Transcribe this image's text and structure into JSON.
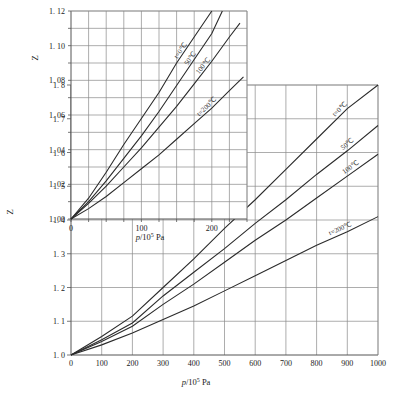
{
  "figure": {
    "name": "compressibility-factor-chart",
    "background": "#ffffff",
    "line_color": "#2b2b2b",
    "grid_color": "#8a8a8a",
    "axis_color": "#555555"
  },
  "chart_data": [
    {
      "id": "main",
      "type": "line",
      "title": "",
      "xlabel": "p/10⁵ Pa",
      "ylabel": "Z",
      "xlim": [
        0,
        1000
      ],
      "ylim": [
        1.0,
        1.8
      ],
      "grid": true,
      "xticks": [
        0,
        100,
        200,
        300,
        400,
        500,
        600,
        700,
        800,
        900,
        1000
      ],
      "xticklabels": [
        "0",
        "100",
        "200",
        "300",
        "400",
        "500",
        "600",
        "700",
        "800",
        "900",
        "1000"
      ],
      "yticks": [
        1.0,
        1.1,
        1.2,
        1.3,
        1.4,
        1.5,
        1.6,
        1.7,
        1.8
      ],
      "yticklabels": [
        "1. 0",
        "1. 1",
        "1. 2",
        "1. 3",
        "1. 4",
        "1. 5",
        "1. 6",
        "1. 7",
        "1. 8"
      ],
      "legend_position": "inline-right",
      "series": [
        {
          "name": "t=0℃",
          "label": "t=0℃",
          "x": [
            0,
            100,
            200,
            300,
            400,
            500,
            600,
            700,
            800,
            900,
            1000
          ],
          "y": [
            1.0,
            1.055,
            1.115,
            1.2,
            1.285,
            1.375,
            1.46,
            1.55,
            1.64,
            1.73,
            1.82
          ]
        },
        {
          "name": "50℃",
          "label": "50℃",
          "x": [
            0,
            100,
            200,
            300,
            400,
            500,
            600,
            700,
            800,
            900,
            1000
          ],
          "y": [
            1.0,
            1.045,
            1.095,
            1.175,
            1.245,
            1.315,
            1.39,
            1.46,
            1.535,
            1.605,
            1.68
          ]
        },
        {
          "name": "100℃",
          "label": "100℃",
          "x": [
            0,
            100,
            200,
            300,
            400,
            500,
            600,
            700,
            800,
            900,
            1000
          ],
          "y": [
            1.0,
            1.04,
            1.085,
            1.15,
            1.21,
            1.275,
            1.34,
            1.4,
            1.465,
            1.53,
            1.595
          ]
        },
        {
          "name": "t=200℃",
          "label": "t=200℃",
          "x": [
            0,
            100,
            200,
            300,
            400,
            500,
            600,
            700,
            800,
            900,
            1000
          ],
          "y": [
            1.0,
            1.03,
            1.065,
            1.105,
            1.145,
            1.19,
            1.235,
            1.28,
            1.325,
            1.365,
            1.41
          ]
        }
      ]
    },
    {
      "id": "inset",
      "type": "line",
      "title": "",
      "xlabel": "p/10⁵ Pa",
      "ylabel": "Z",
      "xlim": [
        0,
        250
      ],
      "ylim": [
        1.0,
        1.12
      ],
      "grid": true,
      "xticks": [
        0,
        25,
        50,
        75,
        100,
        125,
        150,
        175,
        200,
        225,
        250
      ],
      "xticklabels": [
        "0",
        "",
        "",
        "",
        "100",
        "",
        "",
        "",
        "200",
        "",
        ""
      ],
      "yticks": [
        1.0,
        1.01,
        1.02,
        1.03,
        1.04,
        1.05,
        1.06,
        1.07,
        1.08,
        1.09,
        1.1,
        1.11,
        1.12
      ],
      "yticklabels": [
        "1. 00",
        "",
        "1. 02",
        "",
        "1. 04",
        "",
        "1. 06",
        "",
        "1. 08",
        "",
        "1. 10",
        "",
        "1. 12"
      ],
      "legend_position": "inline-top-right",
      "series": [
        {
          "name": "t=0℃",
          "label": "t=0℃",
          "x": [
            0,
            25,
            50,
            75,
            100,
            125,
            150,
            175,
            200
          ],
          "y": [
            1.0,
            1.012,
            1.027,
            1.043,
            1.058,
            1.073,
            1.09,
            1.105,
            1.12
          ]
        },
        {
          "name": "50℃",
          "label": "50℃",
          "x": [
            0,
            25,
            50,
            75,
            100,
            125,
            150,
            175,
            200,
            215
          ],
          "y": [
            1.0,
            1.01,
            1.022,
            1.035,
            1.048,
            1.062,
            1.077,
            1.092,
            1.107,
            1.12
          ]
        },
        {
          "name": "100℃",
          "label": "100℃",
          "x": [
            0,
            25,
            50,
            75,
            100,
            125,
            150,
            175,
            200,
            225,
            240
          ],
          "y": [
            1.0,
            1.009,
            1.019,
            1.03,
            1.041,
            1.053,
            1.065,
            1.078,
            1.091,
            1.105,
            1.113
          ]
        },
        {
          "name": "t=200℃",
          "label": "t=200℃",
          "x": [
            0,
            25,
            50,
            75,
            100,
            125,
            150,
            175,
            200,
            225,
            245
          ],
          "y": [
            1.0,
            1.006,
            1.013,
            1.021,
            1.029,
            1.037,
            1.046,
            1.055,
            1.064,
            1.074,
            1.082
          ]
        }
      ]
    }
  ],
  "main_axis": {
    "ylabel": "Z",
    "xlabel": "p/10⁵ Pa",
    "ytick_1_0": "1. 0",
    "ytick_1_1": "1. 1",
    "ytick_1_2": "1. 2",
    "ytick_1_3": "1. 3",
    "ytick_1_4": "1. 4",
    "ytick_1_5": "1. 5",
    "ytick_1_6": "1. 6",
    "ytick_1_7": "1. 7",
    "ytick_1_8": "1. 8",
    "xtick_0": "0",
    "xtick_100": "100",
    "xtick_200": "200",
    "xtick_300": "300",
    "xtick_400": "400",
    "xtick_500": "500",
    "xtick_600": "600",
    "xtick_700": "700",
    "xtick_800": "800",
    "xtick_900": "900",
    "xtick_1000": "1000",
    "curve_0": "t=0℃",
    "curve_50": "50℃",
    "curve_100": "100℃",
    "curve_200": "t=200℃"
  },
  "inset_axis": {
    "ylabel": "Z",
    "xlabel": "p/10⁵ Pa",
    "ytick_1_00": "1. 00",
    "ytick_1_02": "1. 02",
    "ytick_1_04": "1. 04",
    "ytick_1_06": "1. 06",
    "ytick_1_08": "1. 08",
    "ytick_1_10": "1. 10",
    "ytick_1_12": "1. 12",
    "xtick_0": "0",
    "xtick_100": "100",
    "xtick_200": "200",
    "curve_0": "t=0℃",
    "curve_50": "50℃",
    "curve_100": "100℃",
    "curve_200": "t=200℃"
  }
}
